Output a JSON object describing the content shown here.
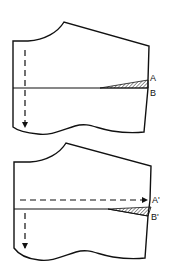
{
  "figure": {
    "top": {
      "labels": {
        "a": "A",
        "b": "B"
      }
    },
    "bottom": {
      "labels": {
        "a": "A'",
        "b": "B'"
      }
    }
  },
  "colors": {
    "stroke": "#111111",
    "background": "#ffffff"
  }
}
